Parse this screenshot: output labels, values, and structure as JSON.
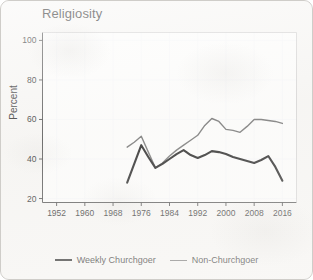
{
  "figure": {
    "title": "Religiosity",
    "background_color": "#f7f6f4",
    "border_color": "#cfcdc9"
  },
  "axes": {
    "ylabel": "Percent",
    "xlabel": ""
  },
  "legend": {
    "weekly": {
      "label": "Weekly Churchgoer",
      "swatch_name": "legend-line-weekly-churchgoer"
    },
    "non": {
      "label": "Non-Churchgoer",
      "swatch_name": "legend-line-non-churchgoer"
    }
  },
  "chart_data": {
    "type": "line",
    "title": "Religiosity",
    "xlabel": "",
    "ylabel": "Percent",
    "xlim": [
      1948,
      2020
    ],
    "ylim": [
      18,
      104
    ],
    "xticks": [
      1952,
      1960,
      1968,
      1976,
      1984,
      1992,
      2000,
      2008,
      2016
    ],
    "yticks": [
      20,
      40,
      60,
      80,
      100
    ],
    "grid": true,
    "legend_position": "bottom-center",
    "series": [
      {
        "name": "Weekly Churchgoer",
        "color": "#191919",
        "width": 2.1,
        "x": [
          1972,
          1974,
          1976,
          1978,
          1980,
          1982,
          1984,
          1986,
          1988,
          1990,
          1992,
          1994,
          1996,
          1998,
          2000,
          2002,
          2004,
          2006,
          2008,
          2010,
          2012,
          2014,
          2016
        ],
        "values": [
          28.0,
          37.5,
          47.0,
          41.0,
          35.5,
          37.5,
          40.0,
          42.5,
          44.5,
          42.0,
          40.5,
          42.0,
          44.0,
          43.5,
          42.5,
          41.0,
          40.0,
          39.0,
          38.0,
          39.5,
          41.5,
          36.0,
          29.0
        ]
      },
      {
        "name": "Non-Churchgoer",
        "color": "#6e6e6e",
        "width": 1.4,
        "x": [
          1972,
          1974,
          1976,
          1978,
          1980,
          1982,
          1984,
          1986,
          1988,
          1990,
          1992,
          1994,
          1996,
          1998,
          2000,
          2002,
          2004,
          2006,
          2008,
          2010,
          2012,
          2014,
          2016
        ],
        "values": [
          46.0,
          48.5,
          51.5,
          43.5,
          35.5,
          38.0,
          41.5,
          44.5,
          47.0,
          49.5,
          52.0,
          57.0,
          60.5,
          59.0,
          55.0,
          54.5,
          53.5,
          56.5,
          60.0,
          60.0,
          59.5,
          59.0,
          58.0
        ]
      }
    ]
  }
}
